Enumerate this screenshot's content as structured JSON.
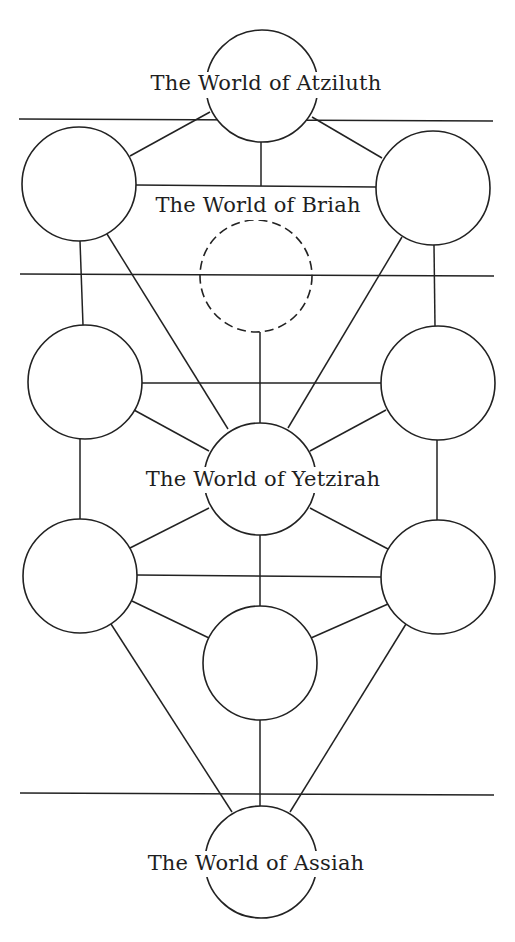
{
  "diagram": {
    "colors": {
      "background": "#ffffff",
      "stroke": "#222222",
      "text": "#1e1e1e"
    },
    "worlds": [
      {
        "id": "atziluth",
        "label": "The World of Atziluth",
        "x": 266,
        "y": 90,
        "bg": [
          133,
          72,
          265,
          26
        ]
      },
      {
        "id": "briah",
        "label": "The World of Briah",
        "x": 258,
        "y": 212,
        "bg": [
          143,
          194,
          229,
          26
        ]
      },
      {
        "id": "yetzirah",
        "label": "The World of Yetzirah",
        "x": 263,
        "y": 486,
        "bg": [
          129,
          467,
          268,
          26
        ]
      },
      {
        "id": "assiah",
        "label": "The World of Assiah",
        "x": 256,
        "y": 870,
        "bg": [
          132,
          851,
          250,
          26
        ]
      }
    ],
    "dividers": [
      {
        "x1": 19,
        "y1": 119,
        "x2": 493,
        "y2": 121
      },
      {
        "x1": 20,
        "y1": 274,
        "x2": 494,
        "y2": 276
      },
      {
        "x1": 20,
        "y1": 793,
        "x2": 494,
        "y2": 795
      }
    ],
    "sephirot": [
      {
        "id": "top-center",
        "cx": 262,
        "cy": 86,
        "r": 56,
        "dashed": false
      },
      {
        "id": "upper-left",
        "cx": 79,
        "cy": 184,
        "r": 57,
        "dashed": false
      },
      {
        "id": "upper-right",
        "cx": 433,
        "cy": 188,
        "r": 57,
        "dashed": false
      },
      {
        "id": "hidden-center",
        "cx": 256,
        "cy": 276,
        "r": 56,
        "dashed": true
      },
      {
        "id": "middle-left",
        "cx": 85,
        "cy": 382,
        "r": 57,
        "dashed": false
      },
      {
        "id": "middle-right",
        "cx": 438,
        "cy": 383,
        "r": 57,
        "dashed": false
      },
      {
        "id": "center",
        "cx": 260,
        "cy": 479,
        "r": 56,
        "dashed": false
      },
      {
        "id": "lower-left",
        "cx": 80,
        "cy": 576,
        "r": 57,
        "dashed": false
      },
      {
        "id": "lower-right",
        "cx": 438,
        "cy": 577,
        "r": 57,
        "dashed": false
      },
      {
        "id": "lower-center",
        "cx": 260,
        "cy": 663,
        "r": 57,
        "dashed": false
      },
      {
        "id": "bottom-center",
        "cx": 261,
        "cy": 862,
        "r": 56,
        "dashed": false
      }
    ],
    "paths": [
      {
        "x1": 210,
        "y1": 112,
        "x2": 130,
        "y2": 156
      },
      {
        "x1": 312,
        "y1": 117,
        "x2": 382,
        "y2": 158
      },
      {
        "x1": 261,
        "y1": 142,
        "x2": 261,
        "y2": 186
      },
      {
        "x1": 136,
        "y1": 185,
        "x2": 376,
        "y2": 187
      },
      {
        "x1": 80,
        "y1": 241,
        "x2": 83,
        "y2": 325
      },
      {
        "x1": 107,
        "y1": 234,
        "x2": 228,
        "y2": 429
      },
      {
        "x1": 434,
        "y1": 245,
        "x2": 435,
        "y2": 326
      },
      {
        "x1": 402,
        "y1": 237,
        "x2": 288,
        "y2": 428
      },
      {
        "x1": 260,
        "y1": 332,
        "x2": 260,
        "y2": 423
      },
      {
        "x1": 142,
        "y1": 383,
        "x2": 381,
        "y2": 383
      },
      {
        "x1": 134,
        "y1": 410,
        "x2": 209,
        "y2": 451
      },
      {
        "x1": 386,
        "y1": 410,
        "x2": 310,
        "y2": 451
      },
      {
        "x1": 80,
        "y1": 439,
        "x2": 80,
        "y2": 520
      },
      {
        "x1": 437,
        "y1": 440,
        "x2": 437,
        "y2": 521
      },
      {
        "x1": 209,
        "y1": 508,
        "x2": 130,
        "y2": 548
      },
      {
        "x1": 310,
        "y1": 508,
        "x2": 388,
        "y2": 549
      },
      {
        "x1": 260,
        "y1": 535,
        "x2": 260,
        "y2": 607
      },
      {
        "x1": 137,
        "y1": 575,
        "x2": 381,
        "y2": 577
      },
      {
        "x1": 132,
        "y1": 601,
        "x2": 209,
        "y2": 638
      },
      {
        "x1": 388,
        "y1": 604,
        "x2": 311,
        "y2": 638
      },
      {
        "x1": 111,
        "y1": 624,
        "x2": 232,
        "y2": 812
      },
      {
        "x1": 406,
        "y1": 624,
        "x2": 290,
        "y2": 812
      },
      {
        "x1": 260,
        "y1": 720,
        "x2": 260,
        "y2": 806
      }
    ]
  }
}
